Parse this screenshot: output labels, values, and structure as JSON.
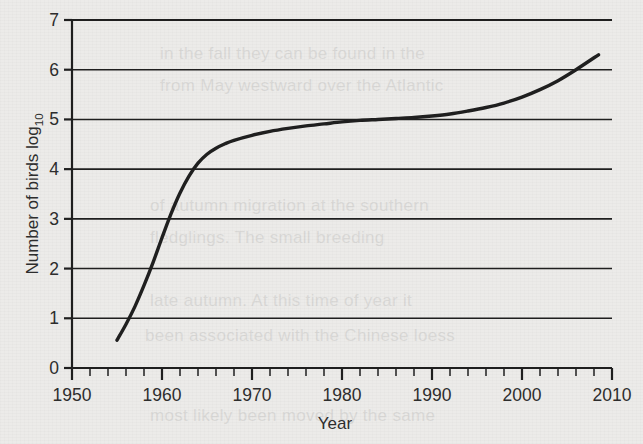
{
  "figure": {
    "background_color": "#ecebe9",
    "ink_color": "#1f1f1f",
    "text_color": "#2d2d2d"
  },
  "ghost_text": {
    "note": "faint show-through text from reverse of printed page",
    "lines": [
      "in the fall they can be found in the",
      "from May westward over the Atlantic",
      "of autumn migration at the southern",
      "fledglings. The small breeding",
      "late autumn. At this time of year it",
      "been associated with the Chinese loess",
      "most likely been moved by the same"
    ]
  },
  "chart_data": {
    "type": "line",
    "title": "",
    "xlabel": "Year",
    "ylabel": "Number of birds log",
    "ylabel_subscript": "10",
    "xlim": [
      1950,
      2010
    ],
    "ylim": [
      0,
      7
    ],
    "x_major_ticks": [
      1950,
      1960,
      1970,
      1980,
      1990,
      2000,
      2010
    ],
    "x_major_tick_labels": [
      "1950",
      "1960",
      "1970",
      "1980",
      "1990",
      "2000",
      "2010"
    ],
    "x_minor_tick_interval": 2,
    "y_ticks": [
      0,
      1,
      2,
      3,
      4,
      5,
      6,
      7
    ],
    "y_tick_labels": [
      "0",
      "1",
      "2",
      "3",
      "4",
      "5",
      "6",
      "7"
    ],
    "grid": "horizontal",
    "legend": "none",
    "series": [
      {
        "name": "Number of birds",
        "line_color": "#1f1f1f",
        "line_width": 3.4,
        "x": [
          1955.0,
          1956.0,
          1957.0,
          1958.0,
          1959.0,
          1960.0,
          1961.0,
          1962.0,
          1963.0,
          1964.0,
          1965.0,
          1966.0,
          1967.0,
          1968.0,
          1970.0,
          1972.0,
          1974.0,
          1976.0,
          1978.0,
          1980.0,
          1982.0,
          1984.0,
          1986.0,
          1988.0,
          1990.0,
          1992.0,
          1994.0,
          1996.0,
          1998.0,
          2000.0,
          2002.0,
          2004.0,
          2006.0,
          2008.5
        ],
        "y": [
          0.56,
          0.88,
          1.24,
          1.66,
          2.12,
          2.62,
          3.1,
          3.52,
          3.86,
          4.12,
          4.3,
          4.42,
          4.51,
          4.58,
          4.68,
          4.76,
          4.82,
          4.87,
          4.91,
          4.95,
          4.98,
          5.0,
          5.02,
          5.04,
          5.07,
          5.11,
          5.17,
          5.24,
          5.33,
          5.45,
          5.6,
          5.78,
          6.0,
          6.3
        ]
      }
    ]
  }
}
